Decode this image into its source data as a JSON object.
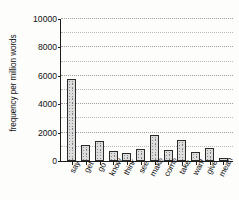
{
  "chart_data": {
    "type": "bar",
    "title": "",
    "xlabel": "",
    "ylabel": "frequency per million words",
    "categories": [
      "say",
      "get",
      "go",
      "know",
      "think",
      "see",
      "make",
      "come",
      "take",
      "want",
      "give",
      "mean"
    ],
    "values": [
      5800,
      1100,
      1400,
      700,
      550,
      850,
      1800,
      750,
      1450,
      600,
      900,
      180
    ],
    "ylim": [
      0,
      10000
    ],
    "y_tick_labels": [
      "0",
      "2000",
      "4000",
      "6000",
      "8000",
      "10000"
    ],
    "y_tick_values": [
      0,
      2000,
      4000,
      6000,
      8000,
      10000
    ],
    "y_minor_step": 1000,
    "grid": "horizontal-dotted",
    "legend": "none",
    "bar_fill": "#dcdcdc",
    "bar_edge": "#2a2a2a",
    "axis_color": "#1b1b1b",
    "grid_color": "#b9b9b9",
    "background": "#fdfdfc"
  }
}
